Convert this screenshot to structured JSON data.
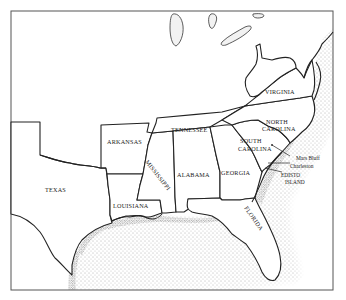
{
  "map": {
    "title": "",
    "region": "Southeastern United States",
    "states": [
      {
        "id": "texas",
        "label": "TEXAS"
      },
      {
        "id": "arkansas",
        "label": "ARKANSAS"
      },
      {
        "id": "louisiana",
        "label": "LOUISIANA"
      },
      {
        "id": "mississippi",
        "label": "MISSISSIPPI"
      },
      {
        "id": "tennessee",
        "label": "TENNESSEE"
      },
      {
        "id": "alabama",
        "label": "ALABAMA"
      },
      {
        "id": "georgia",
        "label": "GEORGIA"
      },
      {
        "id": "florida",
        "label": "FLORIDA"
      },
      {
        "id": "south-carolina",
        "label_line1": "SOUTH",
        "label_line2": "CAROLINA"
      },
      {
        "id": "north-carolina",
        "label_line1": "NORTH",
        "label_line2": "CAROLINA"
      },
      {
        "id": "virginia",
        "label": "VIRGINIA"
      }
    ],
    "places": [
      {
        "id": "mars-bluff",
        "label": "Mars Bluff"
      },
      {
        "id": "charleston",
        "label": "Charleston"
      },
      {
        "id": "edisto-island",
        "label_line1": "EDISTO",
        "label_line2": "ISLAND"
      }
    ],
    "colors": {
      "land": "#ffffff",
      "water_stipple": "#6a6a6a",
      "border": "#222222",
      "frame": "#555555"
    }
  }
}
